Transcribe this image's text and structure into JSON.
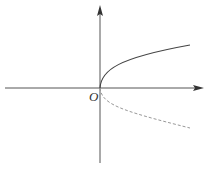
{
  "diagram": {
    "origin_label": "O",
    "colors": {
      "axis": "#555555",
      "solid_curve": "#444444",
      "dashed_curve": "#999999",
      "label": "#333333"
    },
    "curves": [
      {
        "name": "upper-branch",
        "style": "solid",
        "description": "y = sqrt(x) shaped branch, x >= 0"
      },
      {
        "name": "lower-branch",
        "style": "dashed",
        "description": "y = -sqrt(x) shaped branch, x >= 0"
      }
    ]
  }
}
